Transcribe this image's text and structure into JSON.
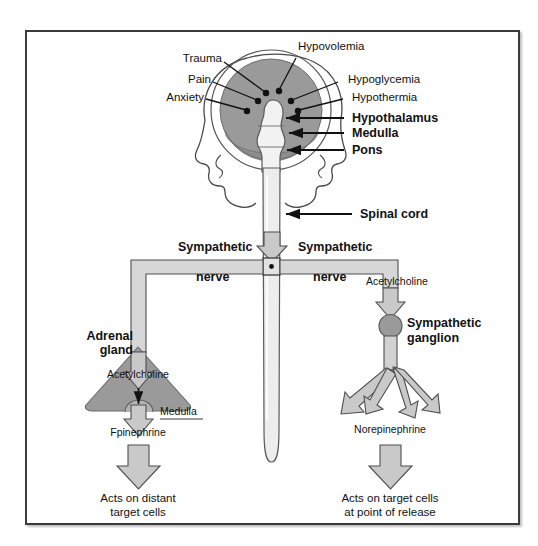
{
  "figure": {
    "frame_color": "#3b3b3b",
    "fill_gray": "#9a9a9a",
    "arrow_gray": "#c9c9c9",
    "ink": "#111111"
  },
  "stimuli": {
    "trauma": "Trauma",
    "hypovolemia": "Hypovolemia",
    "pain": "Pain",
    "hypoglycemia": "Hypoglycemia",
    "anxiety": "Anxiety",
    "hypothermia": "Hypothermia"
  },
  "brain_structures": {
    "hypothalamus": "Hypothalamus",
    "medulla": "Medulla",
    "pons": "Pons"
  },
  "cord": {
    "spinal_cord": "Spinal cord"
  },
  "nerves": {
    "left_line1": "Sympathetic",
    "left_line2": "nerve",
    "right_line1": "Sympathetic",
    "right_line2": "nerve"
  },
  "left_branch": {
    "adrenal_line1": "Adrenal",
    "adrenal_line2": "gland",
    "acetylcholine": "Acetylcholine",
    "medulla": "Medulla",
    "epinephrine": "Fpinephrine",
    "outcome_line1": "Acts on distant",
    "outcome_line2": "target cells"
  },
  "right_branch": {
    "acetylcholine": "Acetylcholine",
    "ganglion_line1": "Sympathetic",
    "ganglion_line2": "ganglion",
    "norepinephrine": "Norepinephrine",
    "outcome_line1": "Acts on target cells",
    "outcome_line2": "at point of release"
  }
}
